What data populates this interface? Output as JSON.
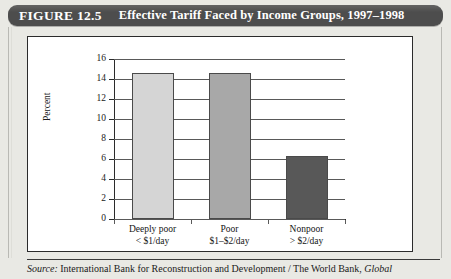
{
  "figure": {
    "number_label": "FIGURE 12.5",
    "title": "Effective Tariff Faced by Income Groups, 1997–1998",
    "source_prefix": "Source:",
    "source_text": " International Bank for Reconstruction and Development / The World Bank, ",
    "source_italic_tail": "Global"
  },
  "chart_data": {
    "type": "bar",
    "title": "Effective Tariff Faced by Income Groups, 1997–1998",
    "xlabel": "",
    "ylabel": "Percent",
    "ylim": [
      0,
      16
    ],
    "yticks": [
      0,
      2,
      4,
      6,
      8,
      10,
      12,
      14,
      16
    ],
    "ytick_labels": [
      "0",
      "2",
      "4",
      "6",
      "8",
      "10",
      "12",
      "14",
      "16"
    ],
    "grid": true,
    "legend": "none",
    "categories": [
      {
        "line1": "Deeply poor",
        "line2": "< $1/day"
      },
      {
        "line1": "Poor",
        "line2": "$1–$2/day"
      },
      {
        "line1": "Nonpoor",
        "line2": "> $2/day"
      }
    ],
    "values": [
      14.6,
      14.6,
      6.3
    ],
    "bar_colors": [
      "#d5d5d5",
      "#a8a8a8",
      "#585858"
    ]
  },
  "colors": {
    "title_bar": "#4d4d4d",
    "title_text": "#ffffff",
    "page_background": "#e9e9e4",
    "panel_background": "#ffffff",
    "axis": "#2b2b2b"
  }
}
